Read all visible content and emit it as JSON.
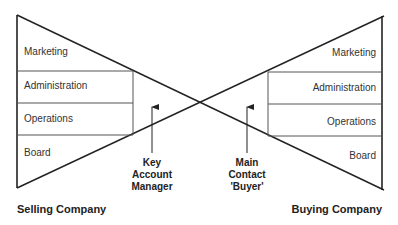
{
  "diagram": {
    "type": "bow-tie relationship model",
    "selling_company": {
      "title": "Selling Company",
      "layers": [
        "Marketing",
        "Administration",
        "Operations",
        "Board"
      ]
    },
    "buying_company": {
      "title": "Buying Company",
      "layers": [
        "Marketing",
        "Administration",
        "Operations",
        "Board"
      ]
    },
    "contacts": {
      "seller_contact": [
        "Key",
        "Account",
        "Manager"
      ],
      "buyer_contact": [
        "Main",
        "Contact",
        "'Buyer'"
      ]
    },
    "colors": {
      "line": "#222222",
      "divider": "#555555",
      "background": "#ffffff"
    }
  }
}
